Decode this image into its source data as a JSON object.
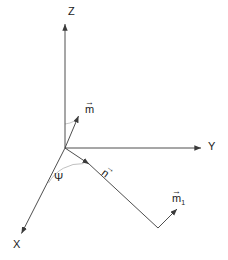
{
  "figure": {
    "background_color": "#ffffff",
    "line_color": "#3a3a3a",
    "arc_color": "#b0b0b0",
    "text_color": "#1a1a1a",
    "width": 228,
    "height": 260
  },
  "axes": [
    {
      "name": "z-axis",
      "label": "Z",
      "from": [
        65,
        148
      ],
      "to": [
        65,
        22
      ],
      "arrow": true
    },
    {
      "name": "y-axis",
      "label": "Y",
      "from": [
        65,
        148
      ],
      "to": [
        203,
        148
      ],
      "arrow": true
    },
    {
      "name": "x-axis",
      "label": "X",
      "from": [
        65,
        148
      ],
      "to": [
        20,
        236
      ],
      "arrow": true
    }
  ],
  "vectors": [
    {
      "name": "m-vector",
      "label": "m",
      "subscript": "",
      "overline_arrow": "→",
      "from": [
        65,
        148
      ],
      "to": [
        79,
        113
      ],
      "arrow": true
    },
    {
      "name": "n-vector",
      "label": "n",
      "subscript": "",
      "overline_arrow": "→",
      "from": [
        65,
        148
      ],
      "to": [
        91,
        166
      ],
      "arrow": true
    },
    {
      "name": "n-extension-line",
      "label": "",
      "subscript": "",
      "overline_arrow": "",
      "from": [
        91,
        166
      ],
      "to": [
        158,
        228
      ],
      "arrow": false
    },
    {
      "name": "m1-vector",
      "label": "m",
      "subscript": "1",
      "overline_arrow": "→",
      "from": [
        158,
        228
      ],
      "to": [
        179,
        207
      ],
      "arrow": true
    }
  ],
  "angles": [
    {
      "name": "psi-angle",
      "label": "Ψ",
      "between": [
        "x-axis",
        "n-vector"
      ],
      "vertex": [
        65,
        148
      ],
      "label_position": [
        57,
        178
      ]
    },
    {
      "name": "theta-angle-unlabeled",
      "label": "",
      "between": [
        "z-axis",
        "m-vector"
      ],
      "vertex": [
        65,
        148
      ],
      "label_position": [
        66,
        126
      ]
    }
  ],
  "labels": {
    "z": "Z",
    "y": "Y",
    "x": "X",
    "m": "m",
    "n": "n",
    "m1": "m",
    "m1_sub": "1",
    "psi": "Ψ",
    "vector_arrow": "→"
  }
}
